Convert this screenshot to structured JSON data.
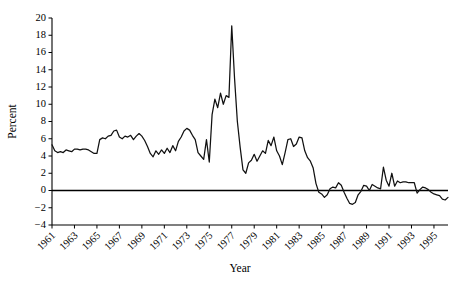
{
  "chart_data": {
    "type": "line",
    "title": "",
    "xlabel": "Year",
    "ylabel": "Percent",
    "xlim": [
      1961,
      1996.25
    ],
    "ylim": [
      -4,
      20
    ],
    "grid": false,
    "legend": "none",
    "xticks": [
      1961,
      1963,
      1965,
      1967,
      1969,
      1971,
      1973,
      1975,
      1977,
      1979,
      1981,
      1983,
      1985,
      1987,
      1989,
      1991,
      1993,
      1995
    ],
    "xtick_labels": [
      "1961",
      "1963",
      "1965",
      "1967",
      "1969",
      "1971",
      "1973",
      "1975",
      "1977",
      "1979",
      "1981",
      "1983",
      "1985",
      "1987",
      "1989",
      "1991",
      "1993",
      "1995"
    ],
    "yticks": [
      -4,
      -2,
      0,
      2,
      4,
      6,
      8,
      10,
      12,
      14,
      16,
      18,
      20
    ],
    "ytick_labels": [
      "−4",
      "−2",
      "0",
      "2",
      "4",
      "6",
      "8",
      "10",
      "12",
      "14",
      "16",
      "18",
      "20"
    ],
    "zero_reference_line": 0,
    "series": [
      {
        "name": "Percent",
        "color": "#111111",
        "x": [
          1961.0,
          1961.25,
          1961.5,
          1961.75,
          1962.0,
          1962.25,
          1962.5,
          1962.75,
          1963.0,
          1963.25,
          1963.5,
          1963.75,
          1964.0,
          1964.25,
          1964.5,
          1964.75,
          1965.0,
          1965.25,
          1965.5,
          1965.75,
          1966.0,
          1966.25,
          1966.5,
          1966.75,
          1967.0,
          1967.25,
          1967.5,
          1967.75,
          1968.0,
          1968.25,
          1968.5,
          1968.75,
          1969.0,
          1969.25,
          1969.5,
          1969.75,
          1970.0,
          1970.25,
          1970.5,
          1970.75,
          1971.0,
          1971.25,
          1971.5,
          1971.75,
          1972.0,
          1972.25,
          1972.5,
          1972.75,
          1973.0,
          1973.25,
          1973.5,
          1973.75,
          1974.0,
          1974.25,
          1974.5,
          1974.75,
          1975.0,
          1975.25,
          1975.5,
          1975.75,
          1976.0,
          1976.25,
          1976.5,
          1976.75,
          1977.0,
          1977.25,
          1977.5,
          1977.75,
          1978.0,
          1978.25,
          1978.5,
          1978.75,
          1979.0,
          1979.25,
          1979.5,
          1979.75,
          1980.0,
          1980.25,
          1980.5,
          1980.75,
          1981.0,
          1981.25,
          1981.5,
          1981.75,
          1982.0,
          1982.25,
          1982.5,
          1982.75,
          1983.0,
          1983.25,
          1983.5,
          1983.75,
          1984.0,
          1984.25,
          1984.5,
          1984.75,
          1985.0,
          1985.25,
          1985.5,
          1985.75,
          1986.0,
          1986.25,
          1986.5,
          1986.75,
          1987.0,
          1987.25,
          1987.5,
          1987.75,
          1988.0,
          1988.25,
          1988.5,
          1988.75,
          1989.0,
          1989.25,
          1989.5,
          1989.75,
          1990.0,
          1990.25,
          1990.5,
          1990.75,
          1991.0,
          1991.25,
          1991.5,
          1991.75,
          1992.0,
          1992.25,
          1992.5,
          1992.75,
          1993.0,
          1993.25,
          1993.5,
          1993.75,
          1994.0,
          1994.25,
          1994.5,
          1994.75,
          1995.0,
          1995.25,
          1995.5,
          1995.75,
          1996.0,
          1996.25
        ],
        "values": [
          5.3,
          4.6,
          4.4,
          4.5,
          4.4,
          4.7,
          4.6,
          4.5,
          4.8,
          4.8,
          4.7,
          4.8,
          4.8,
          4.7,
          4.5,
          4.3,
          4.3,
          5.9,
          6.1,
          6.0,
          6.3,
          6.4,
          6.9,
          7.0,
          6.2,
          6.0,
          6.3,
          6.2,
          6.4,
          5.9,
          6.3,
          6.6,
          6.3,
          5.8,
          5.1,
          4.3,
          3.9,
          4.6,
          4.2,
          4.7,
          4.3,
          4.9,
          4.4,
          5.2,
          4.6,
          5.7,
          6.2,
          6.9,
          7.2,
          7.0,
          6.4,
          5.9,
          4.4,
          4.0,
          3.6,
          5.9,
          3.3,
          8.8,
          10.6,
          9.6,
          11.3,
          10.0,
          11.0,
          10.8,
          19.1,
          13.0,
          8.0,
          5.0,
          2.4,
          2.0,
          3.2,
          3.5,
          4.2,
          3.4,
          4.0,
          4.6,
          4.3,
          5.8,
          5.2,
          6.2,
          4.6,
          4.0,
          3.0,
          4.4,
          5.9,
          6.0,
          5.1,
          5.4,
          6.2,
          6.1,
          4.6,
          3.8,
          3.4,
          2.6,
          0.8,
          -0.2,
          -0.4,
          -0.8,
          -0.5,
          0.2,
          0.4,
          0.3,
          0.9,
          0.6,
          -0.2,
          -0.9,
          -1.5,
          -1.6,
          -1.4,
          -0.5,
          -0.1,
          0.6,
          0.5,
          0.0,
          0.7,
          0.5,
          0.3,
          0.2,
          2.7,
          1.2,
          0.5,
          2.0,
          0.5,
          1.1,
          0.9,
          1.0,
          1.0,
          0.9,
          0.9,
          0.9,
          -0.3,
          0.1,
          0.4,
          0.3,
          0.1,
          -0.2,
          -0.4,
          -0.5,
          -0.6,
          -1.0,
          -1.1,
          -0.8
        ]
      }
    ]
  },
  "labels": {
    "ylabel": "Percent",
    "xlabel": "Year"
  }
}
